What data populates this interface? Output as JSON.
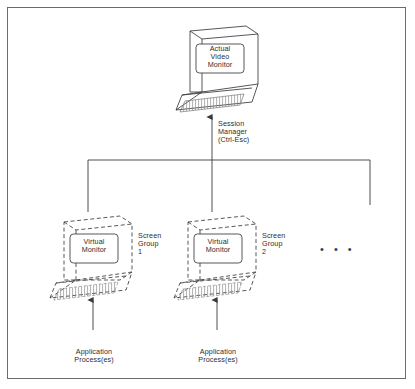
{
  "diagram": {
    "title_present": false,
    "border_color": "#6b6b6b",
    "background": "#ffffff",
    "ink_color": "#3a3a3a",
    "text_color": "#2e2e2e",
    "actual_monitor": {
      "screen_label": "Actual\nVideo\nMonitor",
      "style": "solid"
    },
    "session_manager": {
      "label": "Session\nManager\n(Ctrl-Esc)"
    },
    "screen_groups": [
      {
        "screen_label": "Virtual\nMonitor",
        "group_label": "Screen\nGroup\n1",
        "process_label": "Application\nProcess(es)",
        "style": "dashed"
      },
      {
        "screen_label": "Virtual\nMonitor",
        "group_label": "Screen\nGroup\n2",
        "process_label": "Application\nProcess(es)",
        "style": "dashed"
      }
    ],
    "more_groups_indicator": "• • •"
  }
}
